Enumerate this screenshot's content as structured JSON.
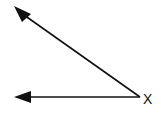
{
  "diagram": {
    "type": "angle",
    "background": "#ffffff",
    "stroke_color": "#111111",
    "vertex": {
      "label": "X",
      "x": 140,
      "y": 97
    },
    "rays": [
      {
        "name": "upper-ray",
        "direction": "up-left",
        "end_x": 14,
        "end_y": 6
      },
      {
        "name": "lower-ray",
        "direction": "left",
        "end_x": 14,
        "end_y": 97
      }
    ]
  }
}
